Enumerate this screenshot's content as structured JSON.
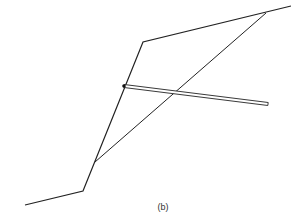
{
  "figure": {
    "caption": "(b)",
    "colors": {
      "line": "#222222",
      "bar_fill": "#ffffff",
      "bar_stroke": "#222222",
      "anchor_head": "#111111"
    },
    "ground_profile": {
      "points": [
        [
          25,
          205
        ],
        [
          83,
          191
        ],
        [
          143,
          42
        ],
        [
          291,
          6
        ]
      ]
    },
    "slip_line": {
      "from": [
        95,
        162
      ],
      "to": [
        266,
        13
      ]
    },
    "anchor": {
      "head": [
        124,
        86
      ],
      "end": [
        268,
        104
      ],
      "thickness": 3
    }
  }
}
